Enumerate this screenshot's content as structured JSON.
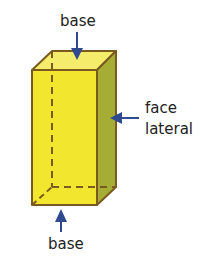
{
  "diagram": {
    "labels": {
      "top_base": "base",
      "bottom_base": "base",
      "lateral_face_line1": "face",
      "lateral_face_line2": "lateral"
    },
    "colors": {
      "front_face": "#f2e62e",
      "top_face": "#f4ec6a",
      "side_face": "#a6ad34",
      "edge": "#7a5a1e",
      "arrow": "#2f4a8f"
    }
  }
}
